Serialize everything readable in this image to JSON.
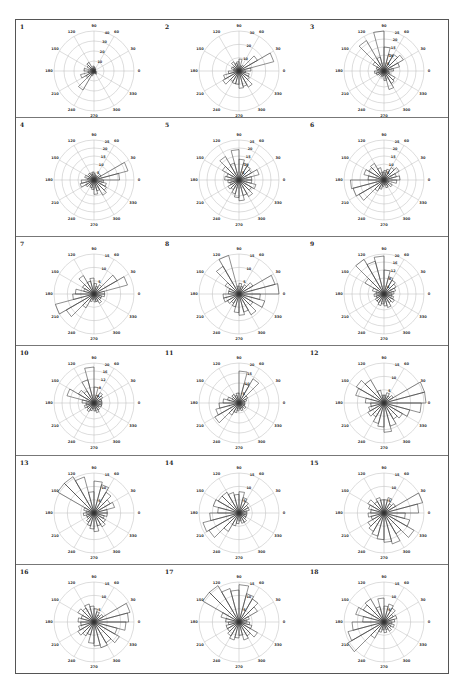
{
  "chart_data": {
    "type": "rose",
    "title": "",
    "layout": {
      "rows": 6,
      "cols": 3,
      "panel_count": 18
    },
    "angle_ticks": [
      0,
      30,
      60,
      90,
      120,
      150,
      180,
      210,
      240,
      270,
      300,
      330
    ],
    "sector_width_deg": 15,
    "panels": [
      {
        "id": "1",
        "rmax": 40,
        "ring_labels": [
          "10",
          "20",
          "30",
          "40"
        ],
        "petals": [
          2,
          1,
          2,
          3,
          2,
          4,
          5,
          3,
          10,
          8,
          4,
          10,
          6,
          14,
          9,
          22,
          5,
          3,
          2,
          3,
          4,
          2,
          3,
          2
        ]
      },
      {
        "id": "2",
        "rmax": 30,
        "ring_labels": [
          "10",
          "20",
          "30"
        ],
        "petals": [
          9,
          27,
          16,
          5,
          4,
          9,
          7,
          6,
          8,
          5,
          6,
          4,
          8,
          12,
          14,
          9,
          10,
          10,
          13,
          12,
          14,
          9,
          8,
          5
        ]
      },
      {
        "id": "3",
        "rmax": 25,
        "ring_labels": [
          "5",
          "10",
          "15",
          "20",
          "25"
        ],
        "petals": [
          6,
          10,
          14,
          12,
          11,
          15,
          25,
          9,
          22,
          8,
          5,
          4,
          6,
          5,
          4,
          3,
          4,
          3,
          6,
          12,
          9,
          8,
          4,
          3
        ]
      },
      {
        "id": "4",
        "rmax": 25,
        "ring_labels": [
          "5",
          "10",
          "15",
          "20",
          "25"
        ],
        "petals": [
          16,
          22,
          5,
          3,
          3,
          4,
          5,
          4,
          5,
          4,
          6,
          4,
          8,
          9,
          6,
          4,
          5,
          6,
          9,
          7,
          11,
          9,
          8,
          6
        ]
      },
      {
        "id": "5",
        "rmax": 25,
        "ring_labels": [
          "5",
          "10",
          "15",
          "20",
          "25"
        ],
        "petals": [
          8,
          13,
          9,
          10,
          11,
          13,
          19,
          11,
          17,
          12,
          8,
          9,
          7,
          6,
          8,
          7,
          9,
          11,
          13,
          10,
          12,
          9,
          11,
          8
        ]
      },
      {
        "id": "6",
        "rmax": 25,
        "ring_labels": [
          "5",
          "10",
          "15",
          "20",
          "25"
        ],
        "petals": [
          10,
          8,
          11,
          9,
          7,
          6,
          5,
          8,
          12,
          11,
          13,
          10,
          21,
          20,
          18,
          8,
          6,
          4,
          3,
          5,
          4,
          6,
          3,
          8
        ]
      },
      {
        "id": "7",
        "rmax": 15,
        "ring_labels": [
          "5",
          "10",
          "15"
        ],
        "petals": [
          4,
          13,
          10,
          4,
          3,
          4,
          6,
          5,
          8,
          5,
          4,
          7,
          8,
          15,
          12,
          6,
          3,
          2,
          3,
          3,
          4,
          3,
          3,
          4
        ]
      },
      {
        "id": "8",
        "rmax": 15,
        "ring_labels": [
          "5",
          "10",
          "15"
        ],
        "petals": [
          15,
          14,
          6,
          4,
          3,
          4,
          3,
          15,
          12,
          6,
          4,
          4,
          6,
          6,
          5,
          4,
          5,
          7,
          8,
          7,
          9,
          6,
          10,
          8
        ]
      },
      {
        "id": "9",
        "rmax": 20,
        "ring_labels": [
          "4",
          "8",
          "12",
          "16",
          "20"
        ],
        "petals": [
          5,
          6,
          7,
          8,
          9,
          12,
          19,
          17,
          20,
          11,
          6,
          4,
          5,
          4,
          5,
          5,
          6,
          5,
          6,
          7,
          5,
          6,
          5,
          4
        ]
      },
      {
        "id": "10",
        "rmax": 20,
        "ring_labels": [
          "4",
          "8",
          "12",
          "16",
          "20"
        ],
        "petals": [
          4,
          4,
          5,
          6,
          4,
          8,
          18,
          12,
          7,
          9,
          14,
          6,
          4,
          5,
          4,
          5,
          4,
          3,
          4,
          5,
          4,
          3,
          4,
          4
        ]
      },
      {
        "id": "11",
        "rmax": 20,
        "ring_labels": [
          "5",
          "10",
          "15",
          "20"
        ],
        "petals": [
          3,
          4,
          5,
          14,
          10,
          16,
          5,
          4,
          5,
          4,
          6,
          8,
          10,
          12,
          14,
          7,
          5,
          4,
          3,
          4,
          3,
          4,
          3,
          3
        ]
      },
      {
        "id": "12",
        "rmax": 15,
        "ring_labels": [
          "5",
          "10",
          "15"
        ],
        "petals": [
          16,
          17,
          4,
          3,
          4,
          3,
          3,
          5,
          10,
          12,
          11,
          7,
          5,
          6,
          7,
          6,
          8,
          9,
          11,
          9,
          7,
          8,
          10,
          14
        ]
      },
      {
        "id": "13",
        "rmax": 15,
        "ring_labels": [
          "5",
          "10",
          "15"
        ],
        "petals": [
          5,
          8,
          7,
          9,
          11,
          12,
          8,
          14,
          17,
          16,
          4,
          3,
          4,
          3,
          3,
          4,
          5,
          6,
          7,
          5,
          6,
          5,
          4,
          5
        ]
      },
      {
        "id": "14",
        "rmax": 15,
        "ring_labels": [
          "5",
          "10",
          "15"
        ],
        "petals": [
          3,
          4,
          4,
          5,
          6,
          8,
          7,
          8,
          9,
          9,
          10,
          8,
          11,
          14,
          13,
          8,
          5,
          4,
          3,
          4,
          4,
          3,
          3,
          3
        ]
      },
      {
        "id": "15",
        "rmax": 15,
        "ring_labels": [
          "5",
          "10",
          "15"
        ],
        "petals": [
          13,
          15,
          5,
          4,
          6,
          5,
          5,
          6,
          5,
          7,
          6,
          5,
          6,
          5,
          7,
          8,
          9,
          10,
          11,
          12,
          9,
          13,
          10,
          8
        ]
      },
      {
        "id": "16",
        "rmax": 15,
        "ring_labels": [
          "5",
          "10",
          "15"
        ],
        "petals": [
          13,
          14,
          4,
          3,
          4,
          5,
          6,
          7,
          6,
          7,
          5,
          6,
          5,
          6,
          7,
          6,
          5,
          8,
          9,
          10,
          9,
          11,
          9,
          12
        ]
      },
      {
        "id": "17",
        "rmax": 15,
        "ring_labels": [
          "5",
          "10",
          "15"
        ],
        "petals": [
          3,
          4,
          8,
          10,
          11,
          14,
          12,
          13,
          16,
          17,
          7,
          5,
          4,
          5,
          5,
          6,
          7,
          6,
          5,
          7,
          6,
          8,
          5,
          4
        ]
      },
      {
        "id": "18",
        "rmax": 15,
        "ring_labels": [
          "5",
          "10",
          "15"
        ],
        "petals": [
          4,
          5,
          4,
          6,
          7,
          6,
          9,
          6,
          10,
          9,
          11,
          8,
          12,
          14,
          16,
          7,
          4,
          3,
          4,
          3,
          4,
          3,
          4,
          3
        ]
      }
    ]
  }
}
